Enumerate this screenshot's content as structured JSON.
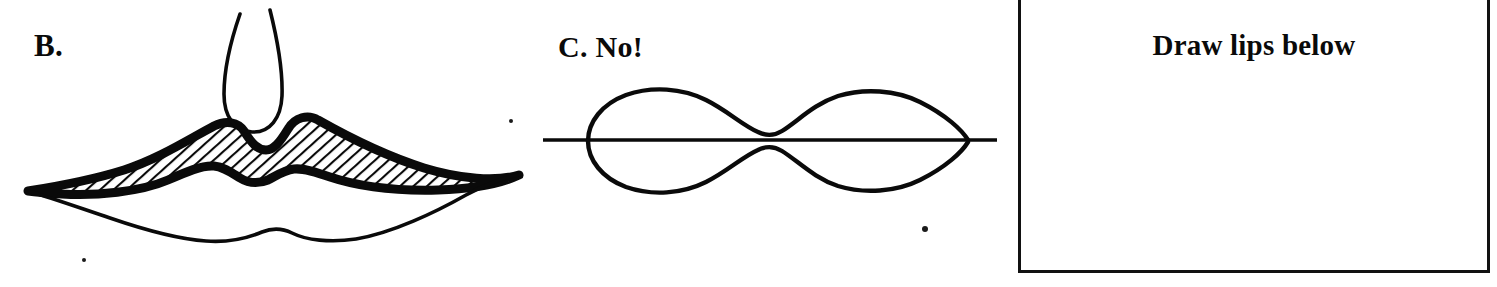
{
  "page": {
    "width": 1497,
    "height": 287,
    "background": "#ffffff",
    "ink_color": "#0a0a0a"
  },
  "panels": {
    "b": {
      "label": "B.",
      "figure_name": "correct-lips-diagram",
      "description": "Line drawing of lips with hatched (diagonally shaded) upper lip, open philtrum groove above, and thin outlined lower lip."
    },
    "c": {
      "label": "C. No!",
      "figure_name": "incorrect-lips-diagram",
      "description": "Symmetrical double-lobed peanut shape bisected by a straight horizontal line, shown as an incorrect way to draw lips."
    },
    "box": {
      "title": "Draw lips below",
      "figure_name": "blank-drawing-area"
    }
  }
}
